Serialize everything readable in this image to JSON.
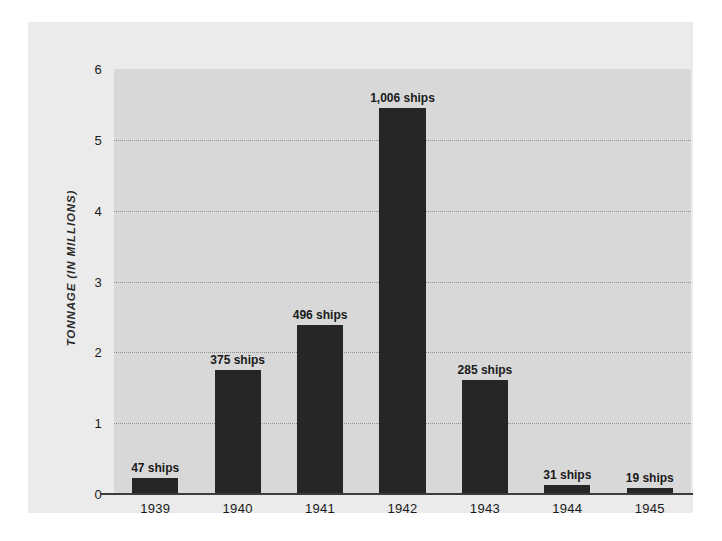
{
  "chart_data": {
    "type": "bar",
    "title": "",
    "subtitle": "",
    "xlabel": "",
    "ylabel": "TONNAGE (IN MILLIONS)",
    "categories": [
      "1939",
      "1940",
      "1941",
      "1942",
      "1943",
      "1944",
      "1945"
    ],
    "values": [
      0.22,
      1.75,
      2.39,
      5.45,
      1.61,
      0.13,
      0.09
    ],
    "data_labels": [
      "47 ships",
      "375 ships",
      "496 ships",
      "1,006 ships",
      "285 ships",
      "31 ships",
      "19 ships"
    ],
    "ship_counts": [
      47,
      375,
      496,
      1006,
      285,
      31,
      19
    ],
    "ylim": [
      0,
      6
    ],
    "ytick_labels": [
      "0",
      "1",
      "2",
      "3",
      "4",
      "5",
      "6"
    ],
    "ytick_values": [
      0,
      1,
      2,
      3,
      4,
      5,
      6
    ],
    "grid": true,
    "grid_axis": "y",
    "legend": false,
    "legend_position": "none",
    "colors": {
      "bar": "#262626",
      "plot_background": "#d8d8d8",
      "figure_background": "#ebebeb",
      "gridline": "#8e8e8e",
      "axis_line": "#3c3c3c",
      "text": "#1a1a1a"
    }
  }
}
